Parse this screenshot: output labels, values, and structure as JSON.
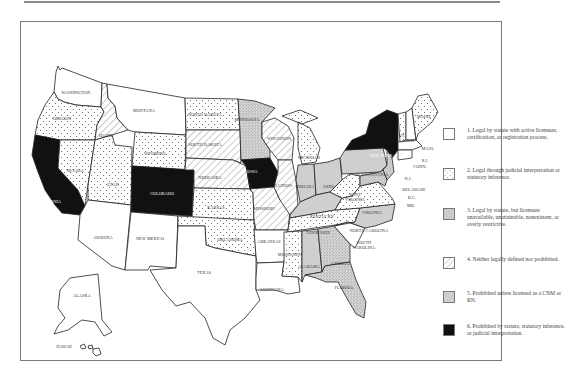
{
  "figure": {
    "type": "choropleth-map"
  },
  "legend": {
    "items": [
      {
        "id": 1,
        "pattern": "blank",
        "label": "1. Legal by statute with active licensure, certification, or registration process."
      },
      {
        "id": 2,
        "pattern": "dots",
        "label": "2. Legal through judicial interpretation or statutory inference."
      },
      {
        "id": 3,
        "pattern": "dense-stipple",
        "label": "3. Legal by statute, but licensure unavailable, unattainable, nonexistent, or overly restrictive."
      },
      {
        "id": 4,
        "pattern": "diagonal-hatch",
        "label": "4. Neither legally defined nor prohibited."
      },
      {
        "id": 5,
        "pattern": "light-gray",
        "label": "5. Prohibited unless licensed as a CNM or RN."
      },
      {
        "id": 6,
        "pattern": "black",
        "label": "6. Prohibited by statute, statutory inference, or judicial interpretation."
      }
    ]
  },
  "states": {
    "WASHINGTON": 1,
    "OREGON": 2,
    "CALIFORNIA": 6,
    "NEVADA": 2,
    "IDAHO": 4,
    "MONTANA": 1,
    "WYOMING": 2,
    "UTAH": 2,
    "ARIZONA": 1,
    "COLORADO": 6,
    "NEW MEXICO": 1,
    "NORTH DAKOTA": 2,
    "SOUTH DAKOTA": 4,
    "NEBRASKA": 4,
    "KANSAS": 2,
    "OKLAHOMA": 2,
    "TEXAS": 1,
    "MINNESOTA": 3,
    "IOWA": 6,
    "MISSOURI": 4,
    "ARKANSAS": 1,
    "LOUISIANA": 1,
    "WISCONSIN": 4,
    "ILLINOIS": 4,
    "MISSISSIPPI": 2,
    "MICHIGAN": 2,
    "INDIANA": 5,
    "OHIO": 5,
    "KENTUCKY": 5,
    "TENNESSEE": 2,
    "ALABAMA": 5,
    "GEORGIA": 3,
    "FLORIDA": 3,
    "SOUTH CAROLINA": 1,
    "NORTH CAROLINA": 5,
    "VIRGINIA": 2,
    "WEST VIRGINIA": 2,
    "PENNSYLVANIA": 5,
    "NEW YORK": 6,
    "VT.": 2,
    "N.H.": 1,
    "MAINE": 2,
    "MASS.": 1,
    "R.I.": 1,
    "CONN.": 1,
    "N.J.": 3,
    "DELAWARE": 1,
    "D.C.": 1,
    "MD.": 3,
    "ALASKA": 1,
    "HAWAII": 1
  },
  "labels": {
    "washington": "WASHINGTON",
    "oregon": "OREGON",
    "california": "CALIFORNIA",
    "nevada": "NEVADA",
    "idaho": "IDAHO",
    "montana": "MONTANA",
    "wyoming": "WYOMING",
    "utah": "UTAH",
    "arizona": "ARIZONA",
    "colorado": "COLORADO",
    "new_mexico": "NEW MEXICO",
    "north_dakota": "NORTH DAKOTA",
    "south_dakota": "SOUTH DAKOTA",
    "nebraska": "NEBRASKA",
    "kansas": "KANSAS",
    "oklahoma": "OKLAHOMA",
    "texas": "TEXAS",
    "minnesota": "MINNESOTA",
    "iowa": "IOWA",
    "missouri": "MISSOURI",
    "arkansas": "ARKANSAS",
    "louisiana": "LOUISIANA",
    "wisconsin": "WISCONSIN",
    "illinois": "ILLINOIS",
    "mississippi": "MISSISSIPPI",
    "michigan": "MICHIGAN",
    "indiana": "INDIANA",
    "ohio": "OHIO",
    "kentucky": "KENTUCKY",
    "tennessee": "TENNESSEE",
    "alabama": "ALABAMA",
    "georgia": "GEORGIA",
    "florida": "FLORIDA",
    "south_carolina_1": "SOUTH",
    "south_carolina_2": "CAROLINA",
    "north_carolina": "NORTH CAROLINA",
    "virginia": "VIRGINIA",
    "west_virginia_1": "WEST",
    "west_virginia_2": "VIRGINIA",
    "pennsylvania": "PENNSYLVANIA",
    "new_york": "NEW YORK",
    "vermont": "VT.",
    "new_hampshire": "N.H.",
    "maine": "MAINE",
    "massachusetts": "MASS.",
    "rhode_island": "R.I.",
    "connecticut": "CONN.",
    "new_jersey": "N.J.",
    "delaware": "DELAWARE",
    "dc": "D.C.",
    "maryland": "MD.",
    "alaska": "ALASKA",
    "hawaii": "HAWAII"
  },
  "colors": {
    "black": "#111111",
    "light_gray": "#cfcfcf",
    "stipple": "#d8d8d8",
    "outline": "#222222",
    "frame": "#7a7a7a"
  }
}
